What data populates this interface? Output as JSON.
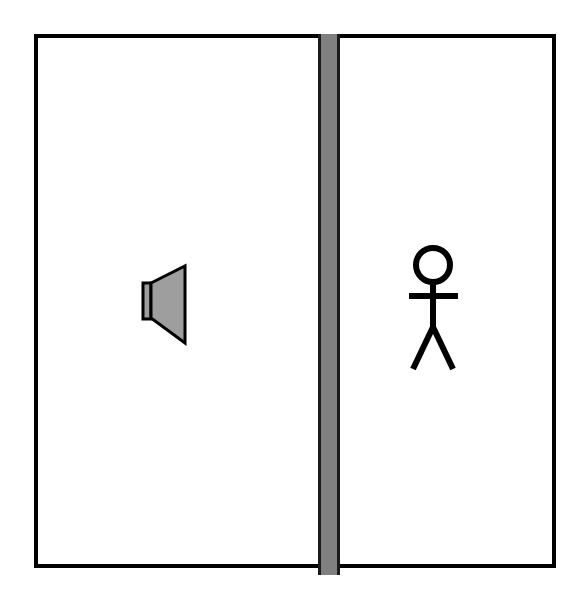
{
  "diagram": {
    "type": "schematic-illustration",
    "background_color": "#ffffff",
    "outline_color": "#000000",
    "fill_color": "#ffffff",
    "room": {
      "label": "enclosure-outline",
      "x": 34,
      "y": 34,
      "width": 522,
      "height": 534,
      "stroke_width": 4,
      "stroke_color": "#000000",
      "fill_color": "#ffffff"
    },
    "partition": {
      "label": "dividing-wall",
      "x": 318,
      "y": 34,
      "width": 22,
      "height": 541,
      "fill_color": "#808080",
      "stroke_color": "#1a1a1a",
      "stroke_width": 3
    },
    "left_room": {
      "label": "source-room",
      "contents": "loudspeaker"
    },
    "right_room": {
      "label": "receiver-room",
      "contents": "person"
    },
    "speaker": {
      "label": "loudspeaker",
      "facing": "left",
      "fill_color": "#9e9e9e",
      "stroke_color": "#000000",
      "stroke_width": 3,
      "magnet_x": 143,
      "magnet_y": 283,
      "magnet_width": 8,
      "magnet_height": 36,
      "cone_points": "151,283 185,266 185,343 151,318"
    },
    "person": {
      "label": "listener",
      "stroke_color": "#000000",
      "stroke_width": 6,
      "head_cx": 433,
      "head_cy": 265,
      "head_r": 17,
      "neck_y1": 282,
      "body_y2": 327,
      "arms_y": 296,
      "arm_x1": 409,
      "arm_x2": 458,
      "leg_left_x": 413,
      "leg_right_x": 453,
      "leg_y": 369
    }
  }
}
